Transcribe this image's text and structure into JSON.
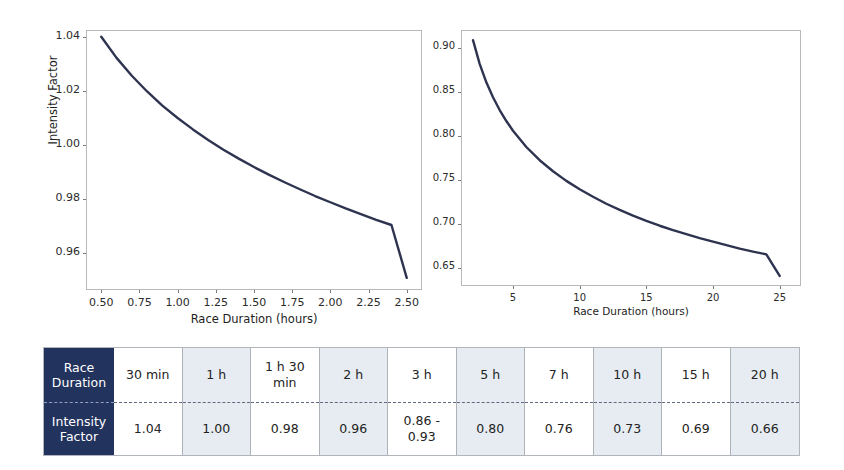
{
  "chart_data": [
    {
      "id": "short-duration-chart",
      "type": "line",
      "title": "",
      "xlabel": "Race Duration (hours)",
      "ylabel": "Intensity Factor",
      "xlim": [
        0.4,
        2.6
      ],
      "ylim": [
        0.9465,
        1.0425
      ],
      "grid": false,
      "legend": "none",
      "line_color": "#2e3450",
      "xticks": [
        "0.50",
        "0.75",
        "1.00",
        "1.25",
        "1.50",
        "1.75",
        "2.00",
        "2.25",
        "2.50"
      ],
      "xtick_values": [
        0.5,
        0.75,
        1.0,
        1.25,
        1.5,
        1.75,
        2.0,
        2.25,
        2.5
      ],
      "yticks": [
        "0.96",
        "0.98",
        "1.00",
        "1.02",
        "1.04"
      ],
      "ytick_values": [
        0.96,
        0.98,
        1.0,
        1.02,
        1.04
      ],
      "x": [
        0.5,
        0.6,
        0.7,
        0.8,
        0.9,
        1.0,
        1.1,
        1.2,
        1.3,
        1.4,
        1.5,
        1.6,
        1.7,
        1.8,
        1.9,
        2.0,
        2.1,
        2.2,
        2.3,
        2.4,
        2.5
      ],
      "values": [
        1.04,
        1.0322,
        1.0256,
        1.0198,
        1.0146,
        1.01,
        1.0058,
        1.0019,
        0.9983,
        0.995,
        0.9919,
        0.989,
        0.9863,
        0.9837,
        0.9812,
        0.9789,
        0.9766,
        0.9745,
        0.9724,
        0.9705,
        0.951
      ]
    },
    {
      "id": "long-duration-chart",
      "type": "line",
      "title": "",
      "xlabel": "Race Duration (hours)",
      "ylabel": "",
      "xlim": [
        1.1,
        26.6
      ],
      "ylim": [
        0.6295,
        0.9205
      ],
      "grid": false,
      "legend": "none",
      "line_color": "#2e3450",
      "xticks": [
        "5",
        "10",
        "15",
        "20",
        "25"
      ],
      "xtick_values": [
        5,
        10,
        15,
        20,
        25
      ],
      "yticks": [
        "0.65",
        "0.70",
        "0.75",
        "0.80",
        "0.85",
        "0.90"
      ],
      "ytick_values": [
        0.65,
        0.7,
        0.75,
        0.8,
        0.85,
        0.9
      ],
      "x": [
        2.0,
        2.5,
        3.0,
        3.5,
        4.0,
        4.5,
        5.0,
        6.0,
        7.0,
        8.0,
        9.0,
        10.0,
        11.0,
        12.0,
        13.0,
        14.0,
        15.0,
        16.0,
        17.0,
        18.0,
        19.0,
        20.0,
        21.0,
        22.0,
        23.0,
        24.0,
        25.0
      ],
      "values": [
        0.909,
        0.882,
        0.861,
        0.844,
        0.8295,
        0.817,
        0.806,
        0.7875,
        0.7725,
        0.76,
        0.749,
        0.7395,
        0.731,
        0.723,
        0.716,
        0.7095,
        0.7035,
        0.698,
        0.693,
        0.6885,
        0.684,
        0.68,
        0.676,
        0.672,
        0.6685,
        0.6655,
        0.641
      ]
    }
  ],
  "table": {
    "row_labels": [
      "Race\nDuration",
      "Intensity\nFactor"
    ],
    "header_bg": "#22335e",
    "shaded_bg": "#e6ecf1",
    "columns": [
      {
        "duration": "30 min",
        "factor": "1.04",
        "shaded": false
      },
      {
        "duration": "1 h",
        "factor": "1.00",
        "shaded": true
      },
      {
        "duration": "1 h 30 min",
        "factor": "0.98",
        "shaded": false
      },
      {
        "duration": "2 h",
        "factor": "0.96",
        "shaded": true
      },
      {
        "duration": "3 h",
        "factor": "0.86 -\n0.93",
        "shaded": false
      },
      {
        "duration": "5 h",
        "factor": "0.80",
        "shaded": true
      },
      {
        "duration": "7 h",
        "factor": "0.76",
        "shaded": false
      },
      {
        "duration": "10 h",
        "factor": "0.73",
        "shaded": true
      },
      {
        "duration": "15 h",
        "factor": "0.69",
        "shaded": false
      },
      {
        "duration": "20 h",
        "factor": "0.66",
        "shaded": true
      }
    ]
  }
}
